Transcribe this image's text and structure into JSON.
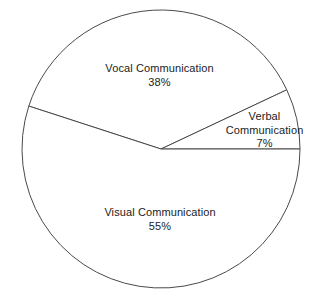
{
  "chart_data": {
    "type": "pie",
    "title": "",
    "subtitle": "",
    "xlabel": "",
    "ylabel": "",
    "legend_position": "none",
    "grid": false,
    "value_unit": "%",
    "total": 100,
    "categories": [
      "Vocal Communication",
      "Verbal Communication",
      "Visual Communication"
    ],
    "values": [
      38,
      7,
      55
    ],
    "slices": [
      {
        "label": "Vocal Communication",
        "value": 38,
        "value_text": "38%",
        "label_lines": [
          "Vocal Communication",
          "38%"
        ],
        "fill": "#ffffff",
        "stroke": "#4a4a4a",
        "start_angle_deg": 25.2,
        "end_angle_deg": 162.0,
        "sweep_deg": 136.8
      },
      {
        "label": "Verbal Communication",
        "value": 7,
        "value_text": "7%",
        "label_lines": [
          "Verbal",
          "Communication",
          "7%"
        ],
        "fill": "#ffffff",
        "stroke": "#4a4a4a",
        "start_angle_deg": 0.0,
        "end_angle_deg": 25.2,
        "sweep_deg": 25.2
      },
      {
        "label": "Visual Communication",
        "value": 55,
        "value_text": "55%",
        "label_lines": [
          "Visual Communication",
          "55%"
        ],
        "fill": "#ffffff",
        "stroke": "#4a4a4a",
        "start_angle_deg": 162.0,
        "end_angle_deg": 360.0,
        "sweep_deg": 198.0
      }
    ]
  },
  "labels": {
    "vocal": {
      "name": "Vocal Communication",
      "percent": "38%"
    },
    "verbal": {
      "name_line1": "Verbal",
      "name_line2": "Communication",
      "percent": "7%"
    },
    "visual": {
      "name": "Visual Communication",
      "percent": "55%"
    }
  },
  "colors": {
    "background": "#ffffff",
    "slice_fill": "#ffffff",
    "slice_stroke": "#4a4a4a",
    "text": "#222222"
  }
}
